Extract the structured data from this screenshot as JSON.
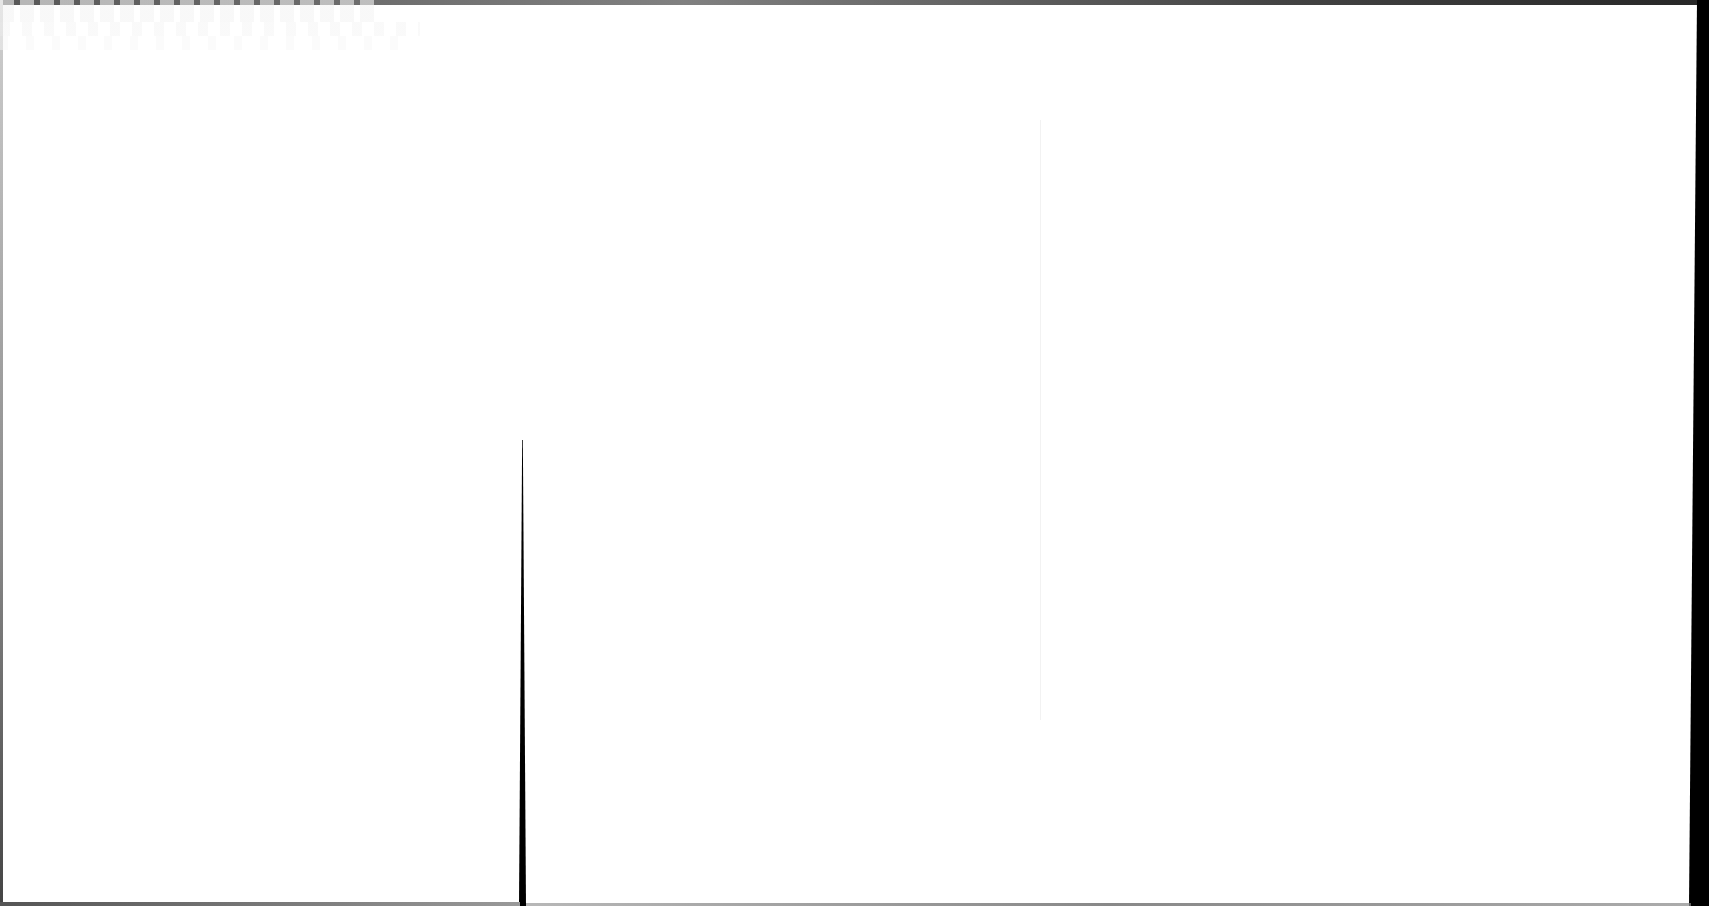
{
  "document": {
    "type": "scanned-page",
    "background_color": "#ffffff",
    "legible_text": [],
    "features": {
      "top_edge_shadow": true,
      "right_edge_shadow": true,
      "center_gutter_line": true,
      "bottom_edge_shadow": true
    },
    "colors": {
      "paper": "#ffffff",
      "scan_edge": "#000000",
      "show_through": "#f4f4f4"
    }
  }
}
